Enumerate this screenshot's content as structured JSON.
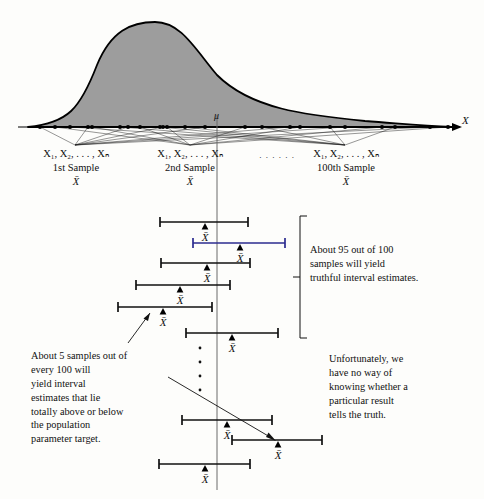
{
  "figure": {
    "axis_label_x": "X",
    "mu_label": "μ",
    "xbar": "X̄",
    "curve_fill": "#9d9d9d",
    "curve_stroke": "#000000",
    "ellipsis_between_samples": ". . . . . ."
  },
  "samples": [
    {
      "vars": "X₁, X₂, . . . , Xₙ",
      "name": "1st Sample",
      "mean": "X̄"
    },
    {
      "vars": "X₁, X₂, . . . , Xₙ",
      "name": "2nd Sample",
      "mean": "X̄"
    },
    {
      "vars": "X₁, X₂, . . . , Xₙ",
      "name": "100th Sample",
      "mean": "X̄"
    }
  ],
  "annotations": {
    "right_top": "About 95 out of 100\nsamples will yield\ntruthful interval estimates.",
    "left_bottom": "About 5 samples out of\nevery 100 will\nyield interval\nestimates that lie\ntotally above or below\nthe population\nparameter target.",
    "right_bottom": "Unfortunately, we\nhave no way of\nknowing whether a\nparticular result\ntells the truth."
  },
  "chart_data": {
    "type": "line",
    "title": "",
    "xlabel": "X",
    "ylabel": "",
    "grid": false,
    "legend": "none",
    "population_mean_x": 217,
    "distribution": {
      "shape": "right-skewed bell curve",
      "peak_x": 155,
      "peak_y_px": 22,
      "baseline_y_px": 127,
      "left_tail_x": 28,
      "right_tail_x": 452
    },
    "sample_dots_x": [
      40,
      55,
      70,
      88,
      92,
      120,
      128,
      140,
      160,
      163,
      167,
      185,
      205,
      245,
      262,
      290,
      300,
      330,
      345,
      382,
      395,
      430,
      448
    ],
    "sample_fan_apex": [
      {
        "sample": 1,
        "x": 75,
        "y": 145
      },
      {
        "sample": 2,
        "x": 190,
        "y": 145
      },
      {
        "sample": 3,
        "x": 345,
        "y": 145
      }
    ],
    "intervals": [
      {
        "index": 1,
        "left": 160,
        "right": 248,
        "mean": 205,
        "y": 222,
        "contains_mu": true,
        "highlight": false
      },
      {
        "index": 2,
        "left": 193,
        "right": 285,
        "mean": 240,
        "y": 243,
        "contains_mu": true,
        "highlight": true
      },
      {
        "index": 3,
        "left": 161,
        "right": 250,
        "mean": 207,
        "y": 263,
        "contains_mu": true,
        "highlight": false
      },
      {
        "index": 4,
        "left": 136,
        "right": 230,
        "mean": 180,
        "y": 285,
        "contains_mu": true,
        "highlight": false
      },
      {
        "index": 5,
        "left": 118,
        "right": 212,
        "mean": 163,
        "y": 307,
        "contains_mu": false,
        "highlight": false
      },
      {
        "index": 6,
        "left": 186,
        "right": 278,
        "mean": 232,
        "y": 333,
        "contains_mu": true,
        "highlight": false
      },
      {
        "index": 7,
        "left": 182,
        "right": 272,
        "mean": 227,
        "y": 420,
        "contains_mu": true,
        "highlight": false
      },
      {
        "index": 8,
        "left": 232,
        "right": 322,
        "mean": 278,
        "y": 440,
        "contains_mu": false,
        "highlight": false
      },
      {
        "index": 9,
        "left": 159,
        "right": 250,
        "mean": 205,
        "y": 464,
        "contains_mu": true,
        "highlight": false
      }
    ],
    "vertical_ellipsis_x": 200,
    "vertical_ellipsis_y": [
      348,
      362,
      376,
      390
    ],
    "brace": {
      "x": 300,
      "y_top": 216,
      "y_bottom": 338
    },
    "mu_line": {
      "x": 217,
      "y_top": 115,
      "y_bottom": 490
    }
  }
}
